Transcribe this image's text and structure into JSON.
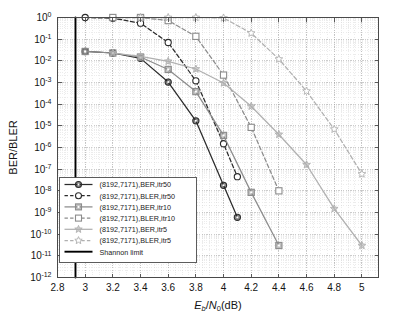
{
  "chart_data": {
    "type": "line",
    "title": "",
    "xlabel": "E_b/N_0(dB)",
    "ylabel": "BER/BLER",
    "xlim": [
      2.8,
      5.12
    ],
    "ylim": [
      1e-12,
      1
    ],
    "yscale": "log",
    "xticks": [
      2.8,
      3,
      3.2,
      3.4,
      3.6,
      3.8,
      4,
      4.2,
      4.4,
      4.6,
      4.8,
      5
    ],
    "xticklabels": [
      "2.8",
      "3",
      "3.2",
      "3.4",
      "3.6",
      "3.8",
      "4",
      "4.2",
      "4.4",
      "4.6",
      "4.8",
      "5"
    ],
    "yticks": [
      1,
      0.1,
      0.01,
      0.001,
      0.0001,
      1e-05,
      1e-06,
      1e-07,
      1e-08,
      1e-09,
      1e-10,
      1e-11,
      1e-12
    ],
    "yticklabels": [
      "10^0",
      "10^-1",
      "10^-2",
      "10^-3",
      "10^-4",
      "10^-5",
      "10^-6",
      "10^-7",
      "10^-8",
      "10^-9",
      "10^-10",
      "10^-11",
      "10^-12"
    ],
    "grid": true,
    "grid_minor": true,
    "legend_position": "lower left",
    "annotations": [
      {
        "name": "shannon-limit",
        "type": "vline",
        "x": 2.93,
        "label": "Shannon limit"
      }
    ],
    "series": [
      {
        "name": "(8192,7171),BER,itr50",
        "marker": "circle",
        "linestyle": "solid",
        "color": "#2b2b2b",
        "x": [
          3.0,
          3.2,
          3.4,
          3.6,
          3.8,
          4.0,
          4.1
        ],
        "y": [
          0.027,
          0.023,
          0.013,
          0.00105,
          1.7e-05,
          1.8e-08,
          6e-10
        ]
      },
      {
        "name": "(8192,7171),BLER,itr50",
        "marker": "circle-open",
        "linestyle": "dashed",
        "color": "#2b2b2b",
        "x": [
          3.0,
          3.2,
          3.4,
          3.6,
          3.8,
          4.0,
          4.1
        ],
        "y": [
          1.0,
          0.93,
          0.55,
          0.07,
          0.0012,
          1.5e-06,
          4.5e-08
        ]
      },
      {
        "name": "(8192,7171),BER,itr10",
        "marker": "square",
        "linestyle": "solid",
        "color": "#8c8c8c",
        "x": [
          3.0,
          3.2,
          3.4,
          3.6,
          3.8,
          4.0,
          4.2,
          4.4
        ],
        "y": [
          0.027,
          0.023,
          0.015,
          0.004,
          0.00038,
          3.6e-06,
          8.5e-09,
          3e-11
        ]
      },
      {
        "name": "(8192,7171),BLER,itr10",
        "marker": "square-open",
        "linestyle": "dashed",
        "color": "#8c8c8c",
        "x": [
          3.2,
          3.4,
          3.6,
          3.8,
          4.0,
          4.2,
          4.4
        ],
        "y": [
          1.0,
          1.0,
          0.72,
          0.135,
          0.0022,
          8.5e-06,
          1e-08
        ]
      },
      {
        "name": "(8192,7171),BER,itr5",
        "marker": "star",
        "linestyle": "solid",
        "color": "#b0b0b0",
        "x": [
          3.2,
          3.4,
          3.6,
          3.8,
          4.0,
          4.2,
          4.4,
          4.6,
          4.8,
          5.0
        ],
        "y": [
          0.023,
          0.016,
          0.0095,
          0.0042,
          0.00095,
          8e-05,
          4e-06,
          1.6e-07,
          1.5e-09,
          3e-11
        ]
      },
      {
        "name": "(8192,7171),BLER,itr5",
        "marker": "star-open",
        "linestyle": "dashed",
        "color": "#b0b0b0",
        "x": [
          3.4,
          3.6,
          3.8,
          4.0,
          4.2,
          4.4,
          4.6,
          4.8,
          5.0
        ],
        "y": [
          1.0,
          1.0,
          1.0,
          0.95,
          0.19,
          0.012,
          0.0004,
          7e-06,
          6e-08
        ]
      },
      {
        "name": "Shannon limit",
        "marker": "none",
        "linestyle": "solid",
        "color": "#000000",
        "x": [
          2.93,
          2.93
        ],
        "y": [
          1,
          1e-12
        ]
      }
    ]
  },
  "legend": {
    "items": [
      {
        "label": "(8192,7171),BER,itr50",
        "marker": "circle",
        "linestyle": "solid",
        "color": "#2b2b2b"
      },
      {
        "label": "(8192,7171),BLER,itr50",
        "marker": "circle-open",
        "linestyle": "dashed",
        "color": "#2b2b2b"
      },
      {
        "label": "(8192,7171),BER,itr10",
        "marker": "square",
        "linestyle": "solid",
        "color": "#8c8c8c"
      },
      {
        "label": "(8192,7171),BLER,itr10",
        "marker": "square-open",
        "linestyle": "dashed",
        "color": "#8c8c8c"
      },
      {
        "label": "(8192,7171),BER,itr5",
        "marker": "star",
        "linestyle": "solid",
        "color": "#b0b0b0"
      },
      {
        "label": "(8192,7171),BLER,itr5",
        "marker": "star-open",
        "linestyle": "dashed",
        "color": "#b0b0b0"
      },
      {
        "label": "Shannon limit",
        "marker": "none",
        "linestyle": "solid",
        "color": "#000000"
      }
    ]
  },
  "axes": {
    "ylabel": "BER/BLER",
    "xlabel_parts": {
      "e": "E",
      "b": "b",
      "slash": "/",
      "n": "N",
      "zero": "0",
      "unit": "(dB)"
    }
  }
}
